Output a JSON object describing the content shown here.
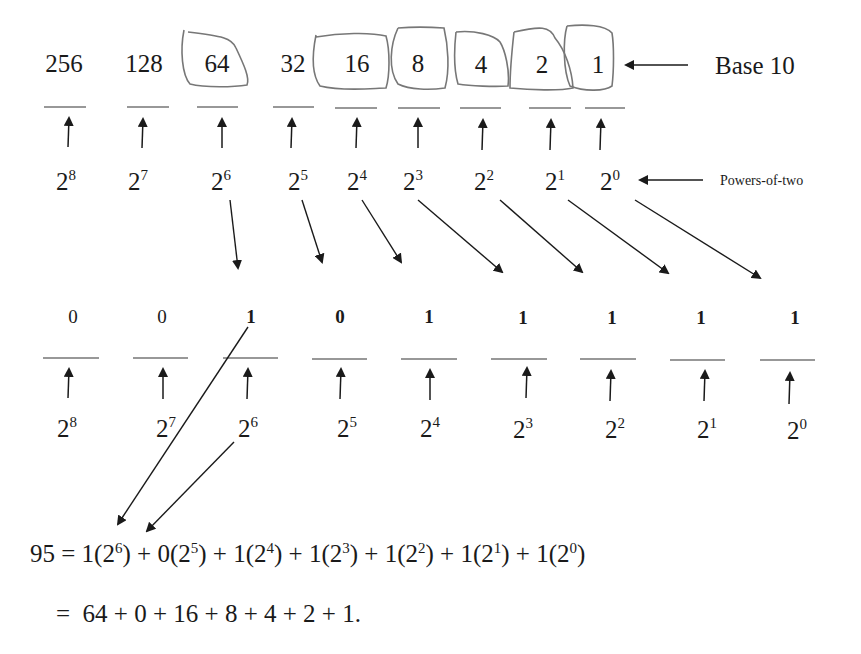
{
  "top_row": {
    "label": "Base 10",
    "values": [
      "256",
      "128",
      "64",
      "32",
      "16",
      "8",
      "4",
      "2",
      "1"
    ],
    "circled": [
      "64",
      "16",
      "8",
      "4",
      "2",
      "1"
    ],
    "powers_label": "Powers-of-two",
    "powers": [
      {
        "base": "2",
        "exp": "8"
      },
      {
        "base": "2",
        "exp": "7"
      },
      {
        "base": "2",
        "exp": "6"
      },
      {
        "base": "2",
        "exp": "5"
      },
      {
        "base": "2",
        "exp": "4"
      },
      {
        "base": "2",
        "exp": "3"
      },
      {
        "base": "2",
        "exp": "2"
      },
      {
        "base": "2",
        "exp": "1"
      },
      {
        "base": "2",
        "exp": "0"
      }
    ]
  },
  "bottom_row": {
    "bits": [
      "0",
      "0",
      "1",
      "0",
      "1",
      "1",
      "1",
      "1",
      "1"
    ],
    "bold": [
      false,
      false,
      true,
      true,
      true,
      true,
      true,
      true,
      true
    ],
    "powers": [
      {
        "base": "2",
        "exp": "8"
      },
      {
        "base": "2",
        "exp": "7"
      },
      {
        "base": "2",
        "exp": "6"
      },
      {
        "base": "2",
        "exp": "5"
      },
      {
        "base": "2",
        "exp": "4"
      },
      {
        "base": "2",
        "exp": "3"
      },
      {
        "base": "2",
        "exp": "2"
      },
      {
        "base": "2",
        "exp": "1"
      },
      {
        "base": "2",
        "exp": "0"
      }
    ]
  },
  "equation": {
    "line1": {
      "lhs": "95 = ",
      "terms": [
        {
          "coef": "1",
          "exp": "6"
        },
        {
          "coef": "0",
          "exp": "5"
        },
        {
          "coef": "1",
          "exp": "4"
        },
        {
          "coef": "1",
          "exp": "3"
        },
        {
          "coef": "1",
          "exp": "2"
        },
        {
          "coef": "1",
          "exp": "1"
        },
        {
          "coef": "1",
          "exp": "0"
        }
      ]
    },
    "line2": "=  64 + 0 + 16 + 8 + 4 + 2 + 1."
  },
  "colors": {
    "ink": "#1a1a1a",
    "circle_stroke": "#777777"
  }
}
